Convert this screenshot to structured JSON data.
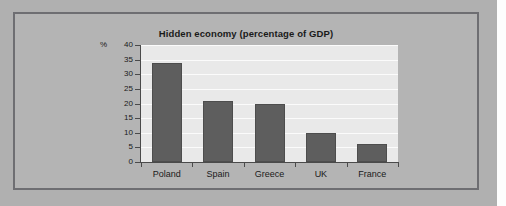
{
  "chart_data": {
    "type": "bar",
    "title": "Hidden economy (percentage of GDP)",
    "xlabel": "",
    "ylabel": "%",
    "categories": [
      "Poland",
      "Spain",
      "Greece",
      "UK",
      "France"
    ],
    "values": [
      34,
      21,
      20,
      10,
      6
    ],
    "ylim": [
      0,
      40
    ],
    "yticks": [
      0,
      5,
      10,
      15,
      20,
      25,
      30,
      35,
      40
    ],
    "ytick_labels": [
      "0",
      "5",
      "10",
      "15",
      "20",
      "25",
      "30",
      "35",
      "40"
    ],
    "grid": true,
    "grid_axis": "y",
    "legend": false,
    "bar_color": "#5e5e5e",
    "plot_background": "#e9e9e9",
    "figure_background": "#b4b4b4"
  },
  "figure": {
    "frame_border_color": "#6e6e72",
    "page_background": "#b0b0b0"
  }
}
